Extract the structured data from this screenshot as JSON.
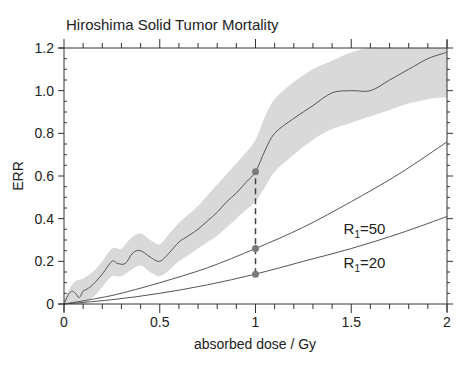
{
  "chart_data": {
    "type": "line",
    "title": "Hiroshima Solid Tumor Mortality",
    "xlabel": "absorbed dose / Gy",
    "ylabel": "ERR",
    "xlim": [
      0,
      2
    ],
    "ylim": [
      0,
      1.2
    ],
    "xticks": [
      0,
      0.5,
      1,
      1.5,
      2
    ],
    "xtick_labels": [
      "0",
      "0.5",
      "1",
      "1.5",
      "2"
    ],
    "yticks": [
      0,
      0.2,
      0.4,
      0.6,
      0.8,
      1.0,
      1.2
    ],
    "ytick_labels": [
      "0",
      "0.2",
      "0.4",
      "0.6",
      "0.8",
      "1.0",
      "1.2"
    ],
    "grid": false,
    "series": [
      {
        "name": "ERR estimate (smoothed)",
        "style": "line",
        "x": [
          0,
          0.02,
          0.04,
          0.06,
          0.08,
          0.1,
          0.12,
          0.15,
          0.2,
          0.25,
          0.28,
          0.32,
          0.36,
          0.4,
          0.45,
          0.5,
          0.55,
          0.6,
          0.65,
          0.7,
          0.75,
          0.8,
          0.85,
          0.9,
          0.95,
          1.0,
          1.05,
          1.1,
          1.2,
          1.3,
          1.4,
          1.5,
          1.6,
          1.7,
          1.8,
          1.9,
          2.0
        ],
        "values": [
          0.0,
          0.04,
          0.06,
          0.05,
          0.03,
          0.06,
          0.07,
          0.09,
          0.14,
          0.2,
          0.19,
          0.19,
          0.24,
          0.25,
          0.22,
          0.2,
          0.24,
          0.29,
          0.32,
          0.35,
          0.39,
          0.43,
          0.48,
          0.52,
          0.57,
          0.62,
          0.72,
          0.8,
          0.87,
          0.93,
          0.99,
          1.0,
          1.0,
          1.05,
          1.1,
          1.15,
          1.18
        ]
      },
      {
        "name": "Confidence band upper",
        "style": "band",
        "x": [
          0,
          0.05,
          0.1,
          0.15,
          0.2,
          0.25,
          0.3,
          0.35,
          0.4,
          0.45,
          0.5,
          0.55,
          0.6,
          0.65,
          0.7,
          0.75,
          0.8,
          0.85,
          0.9,
          0.95,
          1.0,
          1.05,
          1.1,
          1.2,
          1.3,
          1.4,
          1.5,
          1.6,
          1.7,
          1.8,
          1.9,
          2.0
        ],
        "values": [
          0.02,
          0.1,
          0.12,
          0.15,
          0.2,
          0.26,
          0.26,
          0.31,
          0.33,
          0.3,
          0.28,
          0.33,
          0.38,
          0.42,
          0.46,
          0.51,
          0.56,
          0.61,
          0.66,
          0.71,
          0.77,
          0.88,
          0.96,
          1.04,
          1.1,
          1.14,
          1.18,
          1.2,
          1.2,
          1.2,
          1.2,
          1.2
        ]
      },
      {
        "name": "Confidence band lower",
        "style": "band",
        "x": [
          0,
          0.05,
          0.1,
          0.15,
          0.2,
          0.25,
          0.3,
          0.35,
          0.4,
          0.45,
          0.5,
          0.55,
          0.6,
          0.65,
          0.7,
          0.75,
          0.8,
          0.85,
          0.9,
          0.95,
          1.0,
          1.05,
          1.1,
          1.2,
          1.3,
          1.4,
          1.5,
          1.6,
          1.7,
          1.8,
          1.9,
          2.0
        ],
        "values": [
          0.0,
          0.0,
          -0.01,
          0.03,
          0.08,
          0.13,
          0.13,
          0.16,
          0.18,
          0.15,
          0.13,
          0.16,
          0.2,
          0.23,
          0.26,
          0.29,
          0.32,
          0.36,
          0.4,
          0.44,
          0.48,
          0.55,
          0.62,
          0.7,
          0.77,
          0.82,
          0.85,
          0.88,
          0.91,
          0.94,
          0.96,
          0.97
        ]
      },
      {
        "name": "R1=50",
        "style": "line",
        "x": [
          0,
          0.25,
          0.5,
          0.75,
          1.0,
          1.25,
          1.5,
          1.75,
          2.0
        ],
        "values": [
          0,
          0.04,
          0.1,
          0.17,
          0.26,
          0.36,
          0.48,
          0.61,
          0.76
        ]
      },
      {
        "name": "R1=20",
        "style": "line",
        "x": [
          0,
          0.25,
          0.5,
          0.75,
          1.0,
          1.25,
          1.5,
          1.75,
          2.0
        ],
        "values": [
          0,
          0.02,
          0.05,
          0.09,
          0.14,
          0.2,
          0.26,
          0.33,
          0.41
        ]
      }
    ],
    "markers": [
      {
        "x": 1.0,
        "y": 0.62
      },
      {
        "x": 1.0,
        "y": 0.26
      },
      {
        "x": 1.0,
        "y": 0.14
      }
    ],
    "annotations": [
      {
        "text_main": "R",
        "text_sub": "1",
        "text_rest": "=50",
        "x": 1.46,
        "y": 0.33
      },
      {
        "text_main": "R",
        "text_sub": "1",
        "text_rest": "=20",
        "x": 1.46,
        "y": 0.17
      }
    ],
    "vertical_dashed_line": {
      "x": 1.0,
      "y_from": 0.14,
      "y_to": 0.62
    }
  }
}
